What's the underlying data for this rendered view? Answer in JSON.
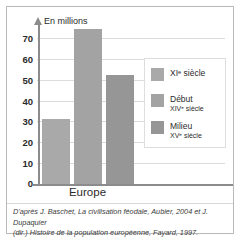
{
  "figure": {
    "axis_title": "En millions",
    "category_label": "Europe",
    "y_ticks": [
      "70",
      "60",
      "50",
      "40",
      "30",
      "20",
      "10",
      "0"
    ],
    "source_line_1": "D'après J. Baschet, La civilisation féodale, Aubier, 2004 et J. Dupaquier",
    "source_line_2": "(dir.) Histoire de la population européenne, Fayard, 1997."
  },
  "legend": {
    "items": [
      {
        "line1": "XI",
        "sup": "e",
        "line1_tail": " siècle",
        "line2": "",
        "color": "#a8a8a8"
      },
      {
        "line1": "Début",
        "line2_pre": "XIV",
        "sup": "e",
        "line2_tail": " siècle",
        "color": "#9e9e9e"
      },
      {
        "line1": "Milieu",
        "line2_pre": "XV",
        "sup": "e",
        "line2_tail": " siècle",
        "color": "#919191"
      }
    ],
    "label_0_l1": "XIᵉ siècle",
    "label_0_l2": "",
    "label_1_l1": "Début",
    "label_1_l2": "XIVᵉ siècle",
    "label_2_l1": "Milieu",
    "label_2_l2": "XVᵉ siècle"
  },
  "colors": {
    "bar_1": "#a9a9a9",
    "bar_2": "#a3a3a3",
    "bar_3": "#969696",
    "grid": "#dcdcdc",
    "axis": "#8c8c8c",
    "frame": "#b9b9b9"
  },
  "chart_data": {
    "type": "bar",
    "title": "",
    "subtitle": "",
    "xlabel": "",
    "ylabel": "En millions",
    "categories": [
      "Europe"
    ],
    "series": [
      {
        "name": "XIᵉ siècle",
        "values": [
          29.5
        ],
        "color": "#a9a9a9"
      },
      {
        "name": "Début XIVᵉ siècle",
        "values": [
          70
        ],
        "color": "#a3a3a3"
      },
      {
        "name": "Milieu XVᵉ siècle",
        "values": [
          49
        ],
        "color": "#969696"
      }
    ],
    "ylim": [
      0,
      73
    ],
    "yticks": [
      0,
      10,
      20,
      30,
      40,
      50,
      60,
      70
    ],
    "grid": true,
    "legend": "right",
    "annotations": [
      "D'après J. Baschet, La civilisation féodale, Aubier, 2004 et J. Dupaquier (dir.) Histoire de la population européenne, Fayard, 1997."
    ]
  }
}
